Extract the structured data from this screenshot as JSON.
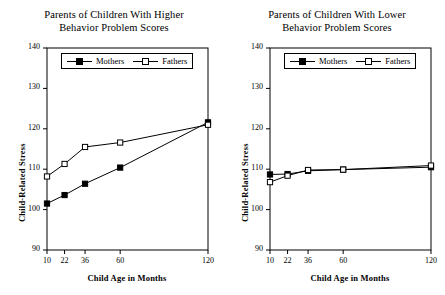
{
  "figure": {
    "background": "#ffffff",
    "line_color": "#000000"
  },
  "panels": [
    {
      "id": "higher",
      "title_line1": "Parents of Children With Higher",
      "title_line2": "Behavior Problem Scores",
      "xlabel": "Child Age in Months",
      "ylabel": "Child-Related Stress",
      "legend": [
        "Mothers",
        "Fathers"
      ]
    },
    {
      "id": "lower",
      "title_line1": "Parents of Children With Lower",
      "title_line2": "Behavior Problem Scores",
      "xlabel": "Child Age in Months",
      "ylabel": "Child-Related Stress",
      "legend": [
        "Mothers",
        "Fathers"
      ]
    }
  ],
  "chart_data": [
    {
      "type": "line",
      "title": "Parents of Children With Higher Behavior Problem Scores",
      "xlabel": "Child Age in Months",
      "ylabel": "Child-Related Stress",
      "x": [
        10,
        22,
        36,
        60,
        120
      ],
      "xtick_labels": [
        "10",
        "22",
        "36",
        "60",
        "120"
      ],
      "xlim": [
        10,
        120
      ],
      "ylim": [
        90,
        140
      ],
      "yticks": [
        90,
        100,
        110,
        120,
        130,
        140
      ],
      "grid": false,
      "legend_position": "top-center",
      "series": [
        {
          "name": "Mothers",
          "marker": "filled-square",
          "values": [
            101.5,
            103.6,
            106.4,
            110.4,
            121.6
          ]
        },
        {
          "name": "Fathers",
          "marker": "open-square",
          "values": [
            108.2,
            111.3,
            115.5,
            116.6,
            121.0
          ]
        }
      ]
    },
    {
      "type": "line",
      "title": "Parents of Children With Lower Behavior Problem Scores",
      "xlabel": "Child Age in Months",
      "ylabel": "Child-Related Stress",
      "x": [
        10,
        22,
        36,
        60,
        120
      ],
      "xtick_labels": [
        "10",
        "22",
        "36",
        "60",
        "120"
      ],
      "xlim": [
        10,
        120
      ],
      "ylim": [
        90,
        140
      ],
      "yticks": [
        90,
        100,
        110,
        120,
        130,
        140
      ],
      "grid": false,
      "legend_position": "top-center",
      "series": [
        {
          "name": "Mothers",
          "marker": "filled-square",
          "values": [
            108.7,
            108.8,
            109.6,
            109.9,
            110.5
          ]
        },
        {
          "name": "Fathers",
          "marker": "open-square",
          "values": [
            106.8,
            108.4,
            109.8,
            109.9,
            110.9
          ]
        }
      ]
    }
  ]
}
